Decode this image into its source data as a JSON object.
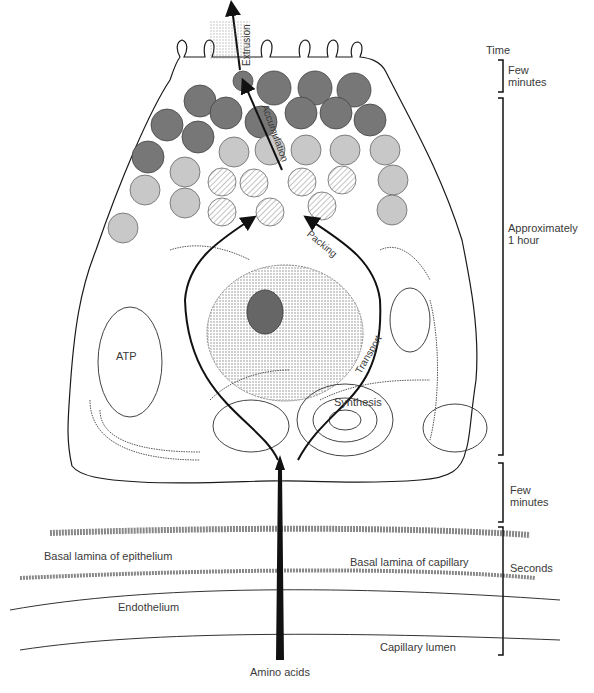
{
  "figure": {
    "time_axis": {
      "header": "Time",
      "segments": [
        {
          "label_line1": "Few",
          "label_line2": "minutes"
        },
        {
          "label_line1": "Approximately",
          "label_line2": "1 hour"
        },
        {
          "label_line1": "Few",
          "label_line2": "minutes"
        },
        {
          "label_line1": "Seconds",
          "label_line2": ""
        }
      ]
    },
    "pathway_labels": {
      "extrusion": "Extrusion",
      "accumulation": "Accumulation",
      "packing": "Packing",
      "transport": "Transport",
      "synthesis": "Synthesis"
    },
    "organelle_labels": {
      "atp": "ATP"
    },
    "structure_labels": {
      "basal_lamina_epithelium": "Basal lamina of epithelium",
      "basal_lamina_capillary": "Basal lamina of capillary",
      "endothelium": "Endothelium",
      "capillary_lumen": "Capillary lumen",
      "amino_acids": "Amino acids"
    },
    "colors": {
      "line": "#1a1a1a",
      "granule_dark": "#6e6e6e",
      "granule_light": "#bdbdbd",
      "stipple": "#9a9a9a"
    }
  }
}
